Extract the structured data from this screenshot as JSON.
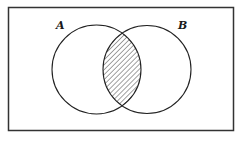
{
  "diagram": {
    "type": "venn",
    "title": "",
    "universe": {
      "shape": "rectangle",
      "x": 8.5,
      "y": 7.5,
      "width": 225,
      "height": 123,
      "stroke": "#333333"
    },
    "sets": [
      {
        "id": "A",
        "label": "A",
        "cx": 96.5,
        "cy": 69.5,
        "r": 44.5,
        "label_x": 56,
        "label_y": 29
      },
      {
        "id": "B",
        "label": "B",
        "cx": 147,
        "cy": 69.5,
        "r": 44,
        "label_x": 178,
        "label_y": 29
      }
    ],
    "shaded_region": {
      "description": "A ∩ B",
      "fill_pattern": "diagonal-hatch",
      "hatch_color": "#444444"
    },
    "colors": {
      "stroke": "#222222",
      "background": "#ffffff"
    }
  }
}
